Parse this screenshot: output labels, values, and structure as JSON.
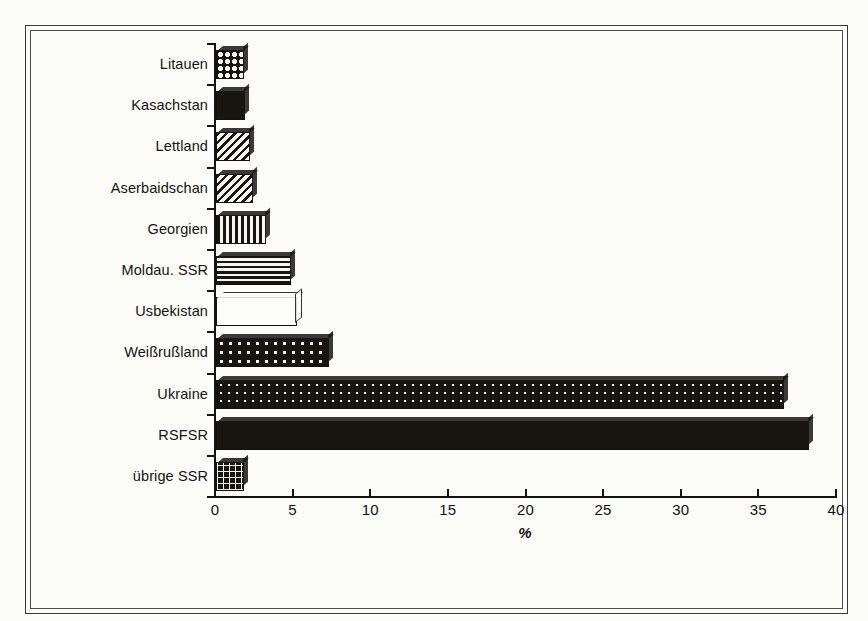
{
  "chart_data": {
    "type": "bar",
    "orientation": "horizontal",
    "title": "",
    "subtitle": "",
    "xlabel": "%",
    "ylabel": "",
    "xlim": [
      0,
      40
    ],
    "xticks": [
      0,
      5,
      10,
      15,
      20,
      25,
      30,
      35,
      40
    ],
    "xticklabels": [
      "0",
      "5",
      "10",
      "15",
      "20",
      "25",
      "30",
      "35",
      "40"
    ],
    "grid": false,
    "legend": false,
    "categories": [
      "Litauen",
      "Kasachstan",
      "Lettland",
      "Aserbaidschan",
      "Georgien",
      "Moldau. SSR",
      "Usbekistan",
      "Weißrußland",
      "Ukraine",
      "RSFSR",
      "übrige SSR"
    ],
    "values": [
      1.8,
      1.9,
      2.2,
      2.4,
      3.2,
      4.8,
      5.2,
      7.3,
      36.6,
      38.2,
      1.8
    ],
    "bar_patterns": [
      "checkerboard",
      "solid-black",
      "diagonal-hatch",
      "diagonal-hatch",
      "vertical-stripes",
      "horizontal-stripes",
      "white-outline",
      "large-dots",
      "small-dots",
      "solid-black",
      "grid-crosshatch"
    ],
    "series": [
      {
        "name": "Anteil",
        "values": [
          1.8,
          1.9,
          2.2,
          2.4,
          3.2,
          4.8,
          5.2,
          7.3,
          36.6,
          38.2,
          1.8
        ]
      }
    ]
  },
  "axis": {
    "x_title": "%",
    "y_title": ""
  },
  "colors": {
    "background": "#fcfcf8",
    "ink": "#141412",
    "frame": "#3a3a38",
    "bar_dark": "#17150f",
    "bar_light": "#f6f6f0"
  }
}
